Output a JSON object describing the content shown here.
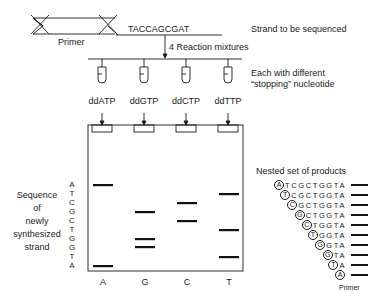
{
  "top": {
    "primer_label": "Primer",
    "template_sequence": "TACCAGCGAT",
    "template_caption": "Strand to be sequenced",
    "reaction_label": "4 Reaction mixtures",
    "tube_caption_line1": "Each with different",
    "tube_caption_line2": "“stopping” nucleotide"
  },
  "reagents": [
    "ddATP",
    "ddGTP",
    "ddCTP",
    "ddTTP"
  ],
  "gel": {
    "lane_labels": [
      "A",
      "G",
      "C",
      "T"
    ],
    "left_caption": [
      "Sequence",
      "of",
      "newly",
      "synthesized",
      "strand"
    ],
    "read_sequence": [
      "A",
      "T",
      "C",
      "G",
      "C",
      "T",
      "G",
      "G",
      "T",
      "A"
    ],
    "bands": [
      {
        "lane": "A",
        "positions": [
          1,
          10
        ]
      },
      {
        "lane": "G",
        "positions": [
          4,
          7,
          8
        ]
      },
      {
        "lane": "C",
        "positions": [
          3,
          5
        ]
      },
      {
        "lane": "T",
        "positions": [
          2,
          6,
          9
        ]
      }
    ]
  },
  "nested": {
    "title": "Nested set of products",
    "rows": [
      {
        "circled": "A",
        "rest": "TCGCTGGTA"
      },
      {
        "circled": "T",
        "rest": "CGCTGGTA"
      },
      {
        "circled": "C",
        "rest": "GCTGGTA"
      },
      {
        "circled": "G",
        "rest": "CTGGTA"
      },
      {
        "circled": "C",
        "rest": "TGGTA"
      },
      {
        "circled": "T",
        "rest": "GGTA"
      },
      {
        "circled": "G",
        "rest": "GTA"
      },
      {
        "circled": "G",
        "rest": "TA"
      },
      {
        "circled": "T",
        "rest": "A"
      },
      {
        "circled": "A",
        "rest": ""
      }
    ],
    "primer_label": "Primer"
  }
}
